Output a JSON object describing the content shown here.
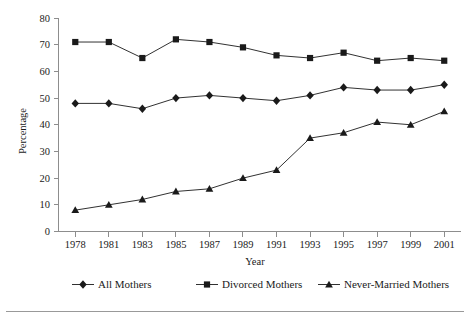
{
  "chart_data": {
    "type": "line",
    "title": "",
    "xlabel": "Year",
    "ylabel": "Percentage",
    "categories": [
      "1978",
      "1981",
      "1983",
      "1985",
      "1987",
      "1989",
      "1991",
      "1993",
      "1995",
      "1997",
      "1999",
      "2001"
    ],
    "x": [
      1978,
      1981,
      1983,
      1985,
      1987,
      1989,
      1991,
      1993,
      1995,
      1997,
      1999,
      2001
    ],
    "ylim": [
      0,
      80
    ],
    "yticks": [
      0,
      10,
      20,
      30,
      40,
      50,
      60,
      70,
      80
    ],
    "ytick_labels": [
      "0",
      "10",
      "20",
      "30",
      "40",
      "50",
      "60",
      "70",
      "80"
    ],
    "grid": false,
    "legend_position": "bottom",
    "series": [
      {
        "name": "All Mothers",
        "marker": "diamond",
        "values": [
          48,
          48,
          46,
          50,
          51,
          50,
          49,
          51,
          54,
          53,
          53,
          55
        ]
      },
      {
        "name": "Divorced Mothers",
        "marker": "square",
        "values": [
          71,
          71,
          65,
          72,
          71,
          69,
          66,
          65,
          67,
          64,
          65,
          64
        ]
      },
      {
        "name": "Never-Married Mothers",
        "marker": "triangle",
        "values": [
          8,
          10,
          12,
          15,
          16,
          20,
          23,
          35,
          37,
          41,
          40,
          45
        ]
      }
    ],
    "colors": {
      "line": "#1a1a1a",
      "marker": "#1a1a1a",
      "axis": "#8d8d8d",
      "text": "#1a1a1a",
      "background": "#ffffff",
      "rule": "#999999"
    }
  }
}
